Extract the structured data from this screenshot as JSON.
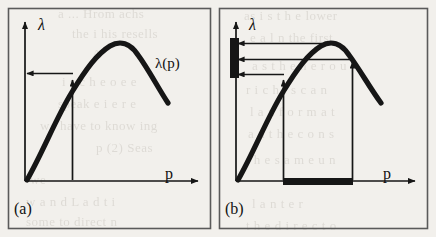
{
  "figure": {
    "width": 436,
    "height": 237,
    "background_color": "#f2f0ec",
    "ink_color": "#1a1a1a",
    "border_color": "#4a4a4a"
  },
  "panels": [
    {
      "tag": "(a)",
      "y_axis_label": "λ",
      "x_axis_label": "p",
      "curve_label": "λ(p)",
      "description": "single operating point: one vertical arrow from p-axis to curve and one horizontal arrow from curve to lambda-axis",
      "markers": {
        "vertical_arrows": 1,
        "horizontal_arrows": 1,
        "axis_bar_lambda": false,
        "axis_bar_p": false
      }
    },
    {
      "tag": "(b)",
      "y_axis_label": "λ",
      "x_axis_label": "p",
      "curve_label": "",
      "description": "interval of operating points: two vertical arrows from p-axis to curve, three horizontal arrows to a thick bar on the lambda-axis, and a thick bar on the p-axis spanning the interval",
      "markers": {
        "vertical_arrows": 2,
        "horizontal_arrows": 3,
        "axis_bar_lambda": true,
        "axis_bar_p": true
      }
    }
  ],
  "chart_data": {
    "type": "line",
    "title": "",
    "xlabel": "p",
    "ylabel": "λ",
    "legend": [
      "λ(p)"
    ],
    "grid": false,
    "xlim": [
      0,
      1
    ],
    "ylim": [
      0,
      1
    ],
    "series": [
      {
        "name": "λ(p)",
        "comment": "concave unimodal throughput curve, rises steeply then falls after the maximum",
        "x": [
          0.0,
          0.08,
          0.16,
          0.24,
          0.32,
          0.4,
          0.48,
          0.56,
          0.64,
          0.72,
          0.8,
          0.88,
          0.96
        ],
        "y": [
          0.0,
          0.22,
          0.42,
          0.58,
          0.72,
          0.84,
          0.92,
          0.97,
          0.99,
          0.95,
          0.86,
          0.73,
          0.58
        ]
      }
    ],
    "annotations": {
      "panel_a": {
        "p_point": 0.3,
        "lambda_point": 0.7
      },
      "panel_b": {
        "p_low": 0.3,
        "p_high": 0.66,
        "lambda_low": 0.7,
        "lambda_peak": 0.99,
        "lambda_high": 0.8,
        "lambda_bar_range": [
          0.7,
          0.99
        ],
        "p_bar_range": [
          0.3,
          0.66
        ]
      }
    }
  },
  "bleed_through": [
    {
      "text": "a ... Hrom achs",
      "x": 58,
      "y": 6
    },
    {
      "text": "the i his resells",
      "x": 72,
      "y": 26
    },
    {
      "text": "A",
      "x": 92,
      "y": 46
    },
    {
      "text": "i s c h e o e e",
      "x": 62,
      "y": 74
    },
    {
      "text": "speak   e i e r e",
      "x": 58,
      "y": 96
    },
    {
      "text": "we  have to  know ing",
      "x": 40,
      "y": 118
    },
    {
      "text": "p  (2)  Seas",
      "x": 96,
      "y": 140
    },
    {
      "text": "we",
      "x": 30,
      "y": 172
    },
    {
      "text": "w a n d  L a d  t  i",
      "x": 26,
      "y": 194
    },
    {
      "text": "some  to  direct  n",
      "x": 26,
      "y": 214
    },
    {
      "text": "as i s t h e  lower",
      "x": 244,
      "y": 8
    },
    {
      "text": "e a l n  the first",
      "x": 250,
      "y": 30
    },
    {
      "text": "a s  t h e  n e r o u",
      "x": 252,
      "y": 58
    },
    {
      "text": "r i c h  i  s  c a n",
      "x": 246,
      "y": 82
    },
    {
      "text": "l a n  f o r m  a t",
      "x": 250,
      "y": 104
    },
    {
      "text": "a n  t h e  c  o n s",
      "x": 248,
      "y": 126
    },
    {
      "text": "t h e  s a m e  u n",
      "x": 246,
      "y": 152
    },
    {
      "text": "l   a  n  t  e  r",
      "x": 252,
      "y": 196
    },
    {
      "text": "t h e  d i r e c t  o",
      "x": 246,
      "y": 218
    }
  ]
}
